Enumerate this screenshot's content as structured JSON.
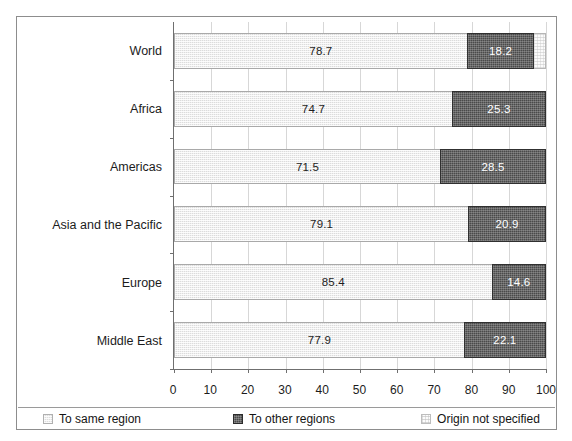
{
  "figure": {
    "title_remnant": "",
    "frame_color": "#8d8d8d"
  },
  "chart_data": {
    "type": "bar",
    "orientation": "horizontal",
    "stacked": true,
    "title": "",
    "xlabel": "",
    "ylabel": "",
    "xlim": [
      0,
      100
    ],
    "xticks": [
      "0",
      "10",
      "20",
      "30",
      "40",
      "50",
      "60",
      "70",
      "80",
      "90",
      "100"
    ],
    "grid": true,
    "legend_position": "bottom",
    "categories": [
      "World",
      "Africa",
      "Americas",
      "Asia and the Pacific",
      "Europe",
      "Middle East"
    ],
    "series": [
      {
        "name": "To same region",
        "color": "#dcdcdc",
        "values": [
          78.7,
          74.7,
          71.5,
          79.1,
          85.4,
          77.9
        ],
        "labels": [
          "78.7",
          "74.7",
          "71.5",
          "79.1",
          "85.4",
          "77.9"
        ]
      },
      {
        "name": "To other regions",
        "color": "#4a4a4a",
        "values": [
          18.2,
          25.3,
          28.5,
          20.9,
          14.6,
          22.1
        ],
        "labels": [
          "18.2",
          "25.3",
          "28.5",
          "20.9",
          "14.6",
          "22.1"
        ]
      },
      {
        "name": "Origin not specified",
        "color": "#fbfbfb",
        "values": [
          3.1,
          0,
          0,
          0,
          0,
          0
        ],
        "labels": [
          "",
          "",
          "",
          "",
          "",
          ""
        ]
      }
    ]
  },
  "legend": {
    "items": [
      {
        "label": "To same region",
        "swatch": "sw-same"
      },
      {
        "label": "To other regions",
        "swatch": "sw-other"
      },
      {
        "label": "Origin not specified",
        "swatch": "sw-unspec"
      }
    ]
  }
}
